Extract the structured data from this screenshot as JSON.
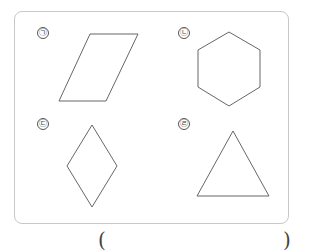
{
  "problem": {
    "shapes": [
      {
        "label": "㉠",
        "name": "parallelogram",
        "points": "59,101 90,34 138,34 106,101"
      },
      {
        "label": "㉡",
        "name": "hexagon",
        "points": "229,32 260,50 260,87 229,106 198,87 198,50"
      },
      {
        "label": "㉢",
        "name": "rhombus",
        "points": "92,125 117,166 92,207 67,166"
      },
      {
        "label": "㉣",
        "name": "triangle",
        "points": "233,131 269,196 197,196"
      }
    ],
    "answer": {
      "open_paren": "(",
      "close_paren": ")",
      "value": ""
    },
    "colors": {
      "border": "#c8c8c8",
      "stroke": "#555555"
    }
  }
}
